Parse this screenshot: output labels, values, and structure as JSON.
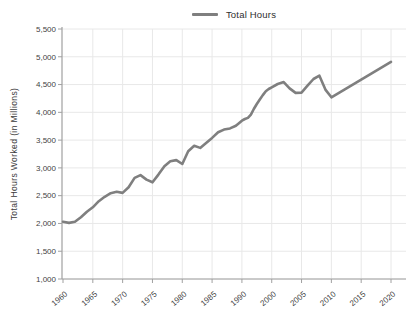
{
  "chart": {
    "legend": {
      "label": "Total Hours"
    },
    "y_axis": {
      "title": "Total Hours Worked (in Millions)",
      "tick_labels": [
        "5,500",
        "5,000",
        "4,500",
        "4,000",
        "3,500",
        "3,000",
        "2,500",
        "2,000",
        "1,500",
        "1,000"
      ]
    },
    "x_axis": {
      "tick_labels": [
        "1960",
        "1965",
        "1970",
        "1975",
        "1980",
        "1985",
        "1990",
        "2000",
        "2005",
        "2010",
        "2015",
        "2020"
      ]
    },
    "colors": {
      "line": "#7f7f7f",
      "grid": "#e8e8e8",
      "axis": "#a0a0a0",
      "text": "#3f3f3f",
      "background": "#ffffff"
    }
  },
  "chart_data": {
    "type": "line",
    "title": "",
    "xlabel": "",
    "ylabel": "Total Hours Worked (in Millions)",
    "ylim": [
      1000,
      5500
    ],
    "ytick_step": 500,
    "grid": true,
    "legend_position": "top",
    "x_tick_labels": [
      "1960",
      "1965",
      "1970",
      "1975",
      "1980",
      "1985",
      "1990",
      "2000",
      "2005",
      "2010",
      "2015",
      "2020"
    ],
    "x_note": "tick labels evenly spaced; 1995 label is skipped between 1990 and 2000",
    "series": [
      {
        "name": "Total Hours",
        "points": [
          [
            1960,
            2030
          ],
          [
            1961,
            2010
          ],
          [
            1962,
            2030
          ],
          [
            1963,
            2110
          ],
          [
            1964,
            2210
          ],
          [
            1965,
            2290
          ],
          [
            1966,
            2400
          ],
          [
            1967,
            2480
          ],
          [
            1968,
            2545
          ],
          [
            1969,
            2570
          ],
          [
            1970,
            2550
          ],
          [
            1971,
            2650
          ],
          [
            1972,
            2820
          ],
          [
            1973,
            2870
          ],
          [
            1974,
            2790
          ],
          [
            1975,
            2740
          ],
          [
            1976,
            2880
          ],
          [
            1977,
            3030
          ],
          [
            1978,
            3120
          ],
          [
            1979,
            3140
          ],
          [
            1980,
            3070
          ],
          [
            1981,
            3300
          ],
          [
            1982,
            3400
          ],
          [
            1983,
            3360
          ],
          [
            1984,
            3450
          ],
          [
            1985,
            3540
          ],
          [
            1986,
            3640
          ],
          [
            1987,
            3690
          ],
          [
            1988,
            3710
          ],
          [
            1989,
            3760
          ],
          [
            1990,
            3850
          ],
          [
            1991,
            3880
          ],
          [
            1992,
            3900
          ],
          [
            1993,
            3960
          ],
          [
            1994,
            4060
          ],
          [
            1995,
            4150
          ],
          [
            1996,
            4230
          ],
          [
            1997,
            4310
          ],
          [
            1998,
            4380
          ],
          [
            1999,
            4420
          ],
          [
            2000,
            4450
          ],
          [
            2001,
            4510
          ],
          [
            2002,
            4545
          ],
          [
            2003,
            4430
          ],
          [
            2004,
            4350
          ],
          [
            2005,
            4355
          ],
          [
            2006,
            4480
          ],
          [
            2007,
            4600
          ],
          [
            2008,
            4660
          ],
          [
            2009,
            4410
          ],
          [
            2010,
            4270
          ],
          [
            2020,
            4910
          ]
        ]
      }
    ]
  }
}
